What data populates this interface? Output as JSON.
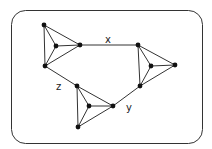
{
  "diagram": {
    "type": "graph",
    "frame": {
      "x": 11,
      "y": 10,
      "width": 191,
      "height": 133,
      "rx": 14
    },
    "nodes": [
      {
        "id": "a1",
        "x": 44,
        "y": 25
      },
      {
        "id": "a2",
        "x": 80,
        "y": 45
      },
      {
        "id": "a3",
        "x": 45,
        "y": 66
      },
      {
        "id": "a0",
        "x": 56,
        "y": 46
      },
      {
        "id": "b1",
        "x": 138,
        "y": 45
      },
      {
        "id": "b2",
        "x": 175,
        "y": 65
      },
      {
        "id": "b3",
        "x": 140,
        "y": 86
      },
      {
        "id": "b0",
        "x": 151,
        "y": 66
      },
      {
        "id": "c1",
        "x": 77,
        "y": 86
      },
      {
        "id": "c2",
        "x": 113,
        "y": 106
      },
      {
        "id": "c3",
        "x": 78,
        "y": 127
      },
      {
        "id": "c0",
        "x": 89,
        "y": 106
      }
    ],
    "edges": [
      [
        "a1",
        "a2"
      ],
      [
        "a2",
        "a3"
      ],
      [
        "a3",
        "a1"
      ],
      [
        "a0",
        "a1"
      ],
      [
        "a0",
        "a2"
      ],
      [
        "a0",
        "a3"
      ],
      [
        "b1",
        "b2"
      ],
      [
        "b2",
        "b3"
      ],
      [
        "b3",
        "b1"
      ],
      [
        "b0",
        "b1"
      ],
      [
        "b0",
        "b2"
      ],
      [
        "b0",
        "b3"
      ],
      [
        "c1",
        "c2"
      ],
      [
        "c2",
        "c3"
      ],
      [
        "c3",
        "c1"
      ],
      [
        "c0",
        "c1"
      ],
      [
        "c0",
        "c2"
      ],
      [
        "c0",
        "c3"
      ],
      [
        "a2",
        "b1"
      ],
      [
        "b3",
        "c2"
      ],
      [
        "a3",
        "c1"
      ]
    ],
    "labels": [
      {
        "id": "x",
        "text": "x",
        "x": 105,
        "y": 43
      },
      {
        "id": "y",
        "text": "y",
        "x": 126,
        "y": 111
      },
      {
        "id": "z",
        "text": "z",
        "x": 56,
        "y": 90
      }
    ]
  }
}
